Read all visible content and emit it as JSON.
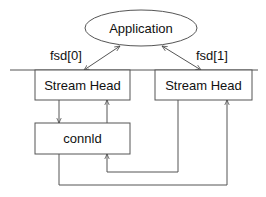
{
  "diagram": {
    "nodes": {
      "application": {
        "label": "Application",
        "shape": "ellipse"
      },
      "stream_head_0": {
        "label": "Stream Head",
        "shape": "rect"
      },
      "stream_head_1": {
        "label": "Stream Head",
        "shape": "rect"
      },
      "connld": {
        "label": "connld",
        "shape": "rect"
      }
    },
    "edge_labels": {
      "fsd0": "fsd[0]",
      "fsd1": "fsd[1]"
    },
    "edges": [
      {
        "from": "application",
        "to": "stream_head_0",
        "label": "fsd[0]",
        "bidirectional": true
      },
      {
        "from": "application",
        "to": "stream_head_1",
        "label": "fsd[1]",
        "bidirectional": true
      },
      {
        "from": "stream_head_0",
        "to": "connld",
        "bidirectional": false
      },
      {
        "from": "connld",
        "to": "stream_head_0",
        "bidirectional": false
      },
      {
        "from": "stream_head_1",
        "to": "connld",
        "bidirectional": false
      },
      {
        "from": "connld",
        "to": "stream_head_1",
        "bidirectional": false
      }
    ],
    "colors": {
      "stroke": "#555555",
      "text": "#111111",
      "background": "#ffffff"
    }
  }
}
